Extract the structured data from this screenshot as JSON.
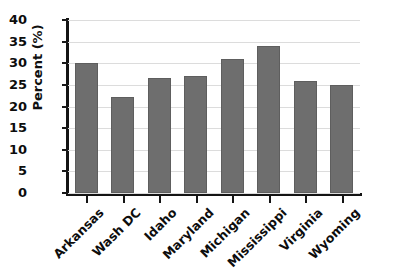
{
  "chart_data": {
    "type": "bar",
    "title": "",
    "xlabel": "",
    "ylabel": "Percent (%)",
    "categories": [
      "Arkansas",
      "Wash DC",
      "Idaho",
      "Maryland",
      "Michigan",
      "Mississippi",
      "Virginia",
      "Wyoming"
    ],
    "values": [
      30,
      22.3,
      26.7,
      27,
      31,
      34,
      26,
      25
    ],
    "ylim": [
      0,
      40
    ],
    "ytick_labels": [
      "40",
      "35",
      "30",
      "25",
      "20",
      "15",
      "10",
      "5",
      "0"
    ],
    "ytick_values": [
      40,
      35,
      30,
      25,
      20,
      15,
      10,
      5,
      0
    ],
    "grid": true,
    "legend": false,
    "bar_color": "#6e6e6e",
    "grid_color": "#dcdcdc",
    "axis_color": "#141414",
    "background_color": "#ffffff",
    "xtick_label_rotation": -45
  }
}
